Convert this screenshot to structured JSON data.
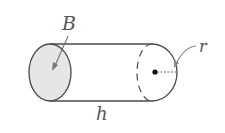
{
  "diagram": {
    "labels": {
      "base": "B",
      "height": "h",
      "radius": "r"
    },
    "colors": {
      "outline": "#4a4a4a",
      "base_fill": "#e6e6e6",
      "label": "#555555"
    }
  }
}
